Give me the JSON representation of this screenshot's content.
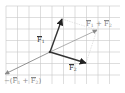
{
  "diagram": {
    "type": "vector-addition",
    "grid": {
      "x0": 6,
      "y0": 6,
      "x1": 120,
      "y1": 84,
      "cell": 11.5,
      "color": "#c8c8c8"
    },
    "origin": {
      "x": 50,
      "y": 52
    },
    "vectors": [
      {
        "id": "F1",
        "tip": {
          "x": 62,
          "y": 19
        },
        "color": "#333333",
        "style": "solid",
        "width": 1.4
      },
      {
        "id": "F2",
        "tip": {
          "x": 86,
          "y": 63
        },
        "color": "#333333",
        "style": "solid",
        "width": 1.4
      },
      {
        "id": "F1_plus_F2",
        "tip": {
          "x": 97,
          "y": 30
        },
        "color": "#9a9a9a",
        "style": "solid",
        "width": 0.8
      },
      {
        "id": "neg_F1_plus_F2",
        "tip": {
          "x": 5,
          "y": 74
        },
        "color": "#7a7a7a",
        "style": "solid",
        "width": 0.8
      }
    ],
    "construction_lines": [
      {
        "from": {
          "x": 62,
          "y": 19
        },
        "to": {
          "x": 97,
          "y": 30
        },
        "color": "#d0d0d0"
      },
      {
        "from": {
          "x": 86,
          "y": 63
        },
        "to": {
          "x": 97,
          "y": 30
        },
        "color": "#d0d0d0"
      }
    ],
    "labels": {
      "f1": {
        "base": "F",
        "sub": "1"
      },
      "f2": {
        "base": "F",
        "sub": "2"
      },
      "sum": {
        "base1": "F",
        "sub1": "1",
        "op": " + ",
        "base2": "F",
        "sub2": "2"
      },
      "neg_sum": {
        "prefix": "−(",
        "base1": "F",
        "sub1": "1",
        "op": " + ",
        "base2": "F",
        "sub2": "2",
        "suffix": ")"
      }
    }
  }
}
